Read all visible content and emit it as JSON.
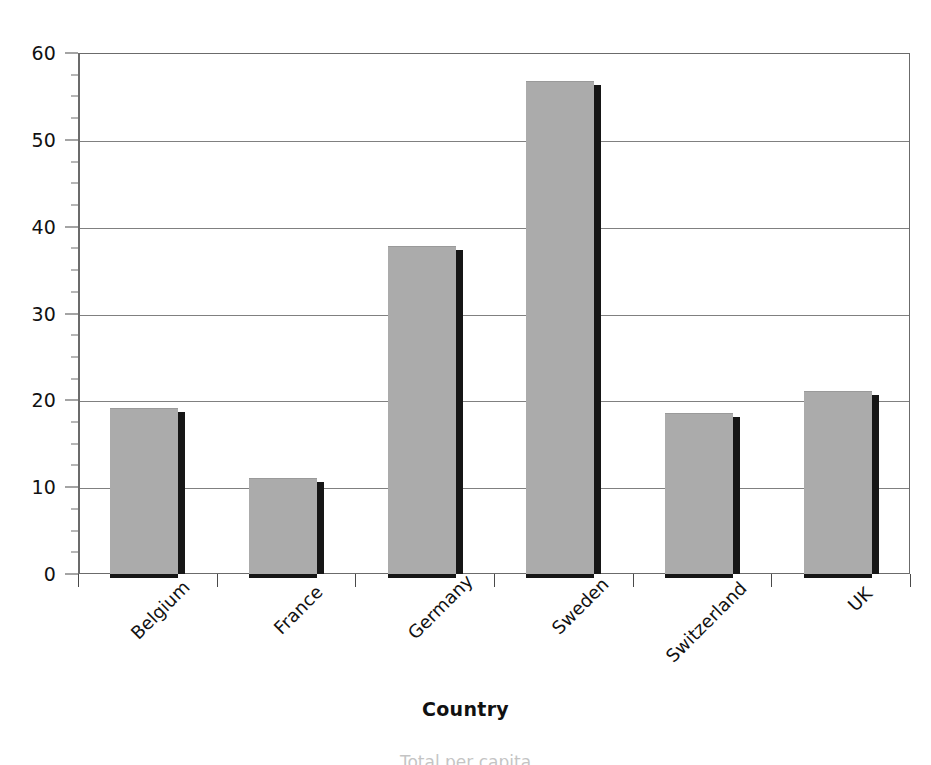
{
  "chart_data": {
    "type": "bar",
    "title": "",
    "subtitle": "",
    "xlabel": "Country",
    "ylabel": "",
    "categories": [
      "Belgium",
      "France",
      "Germany",
      "Sweden",
      "Switzerland",
      "UK"
    ],
    "values": [
      19.1,
      11.0,
      37.8,
      56.8,
      18.6,
      21.1
    ],
    "series": [
      {
        "name": "",
        "values": [
          19.1,
          11.0,
          37.8,
          56.8,
          18.6,
          21.1
        ]
      }
    ],
    "ylim": [
      0,
      60
    ],
    "xlim_categories": 6,
    "y_major_ticks": [
      0,
      10,
      20,
      30,
      40,
      50,
      60
    ],
    "y_tick_labels": [
      "0",
      "10",
      "20",
      "30",
      "40",
      "50",
      "60"
    ],
    "y_minor_tick_interval": 2.5,
    "grid": "horizontal-major",
    "legend": "none",
    "legend_position": "none",
    "bar_color": "#ababab",
    "bar_shadow_color": "#161616",
    "gridline_color": "#808080",
    "axis_color": "#4a4a4a",
    "background_color": "#ffffff",
    "annotations": []
  },
  "axis_title": {
    "text": "Country"
  },
  "footer": {
    "clipped_caption": "Total per capita"
  }
}
